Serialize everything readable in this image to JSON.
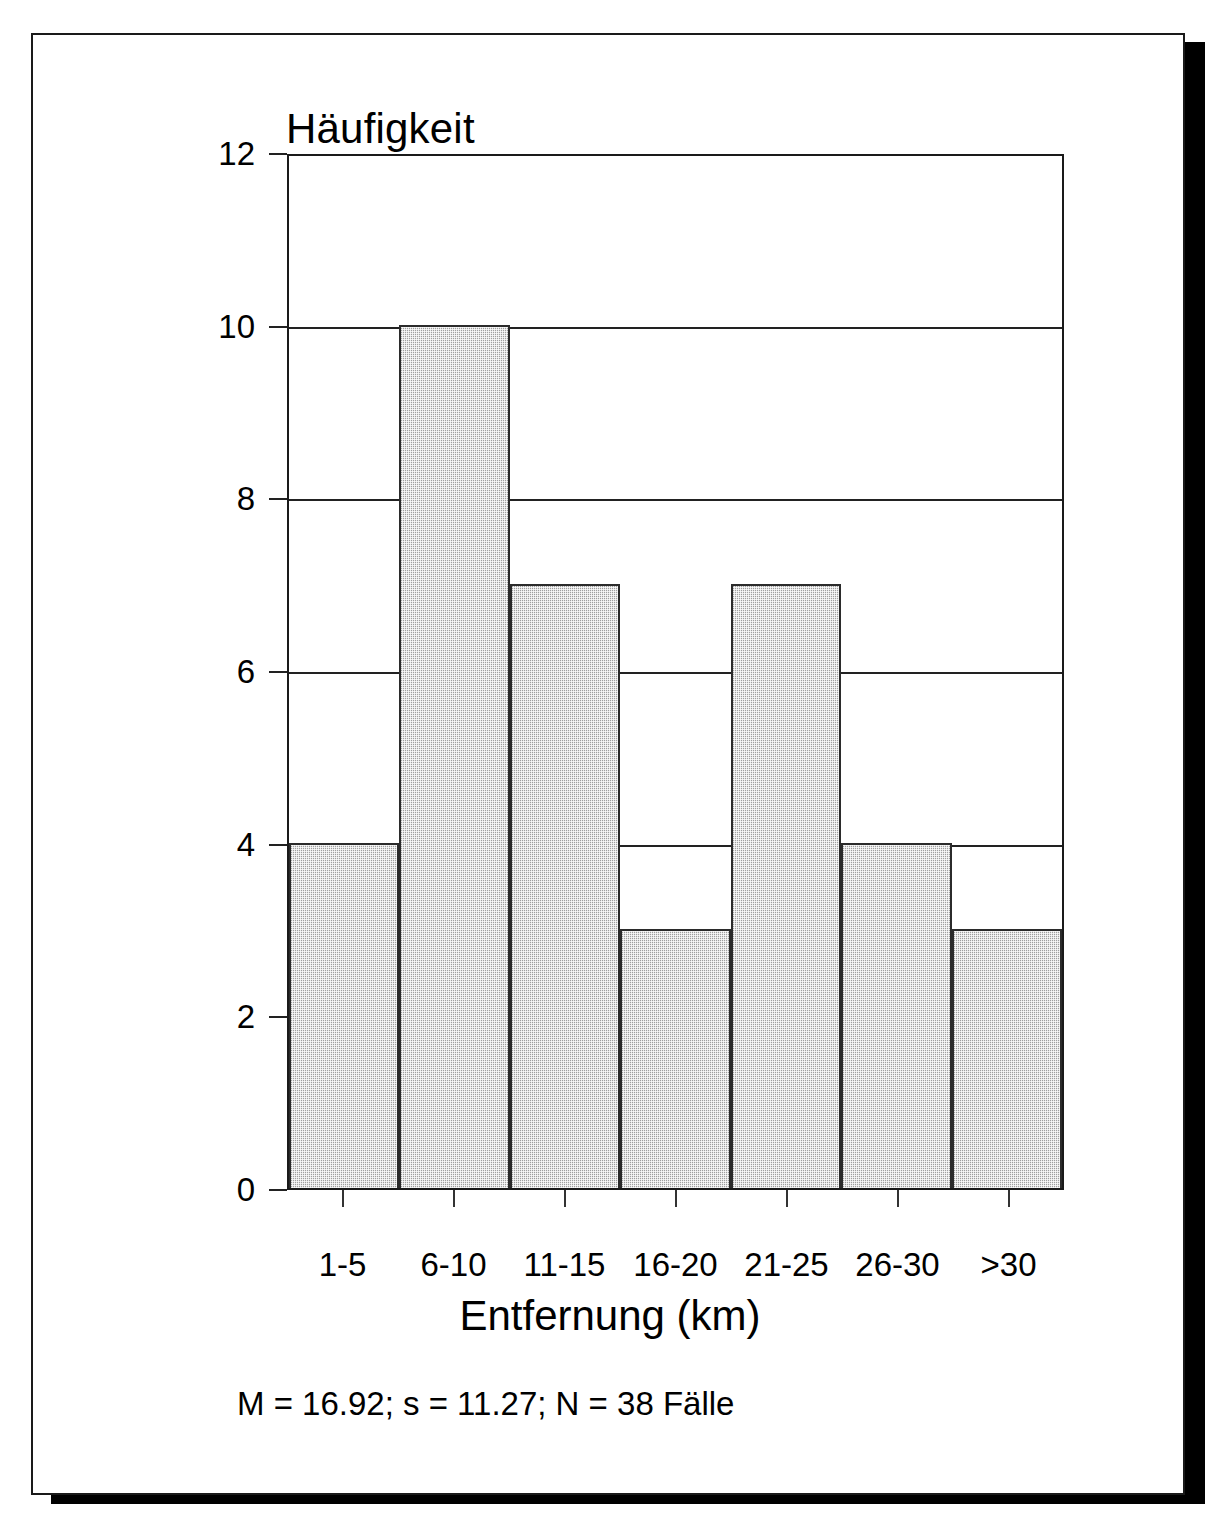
{
  "chart_data": {
    "type": "bar",
    "title": "Häufigkeit",
    "xlabel": "Entfernung (km)",
    "ylabel": "Häufigkeit",
    "categories": [
      "1-5",
      "6-10",
      "11-15",
      "16-20",
      "21-25",
      "26-30",
      ">30"
    ],
    "values": [
      4,
      10,
      7,
      3,
      7,
      4,
      3
    ],
    "ylim": [
      0,
      12
    ],
    "yticks": [
      0,
      2,
      4,
      6,
      8,
      10,
      12
    ],
    "ytick_labels": [
      "0",
      "2",
      "4",
      "6",
      "8",
      "10",
      "12"
    ],
    "gridlines": [
      2,
      4,
      6,
      8,
      10
    ],
    "grid": true,
    "legend": null,
    "annotation": "M = 16.92; s = 11.27; N = 38 Fälle",
    "statistics": {
      "mean_label": "M",
      "mean": "16.92",
      "sd_label": "s",
      "sd": "11.27",
      "n_label": "N",
      "n": "38",
      "n_unit": "Fälle"
    },
    "colors": {
      "bar_fill": "#cfcfcf",
      "bar_border": "#2b2b2b",
      "axis": "#1a1a1a",
      "grid": "#222222",
      "text": "#000000",
      "page": "#ffffff",
      "shadow": "#000000"
    }
  }
}
